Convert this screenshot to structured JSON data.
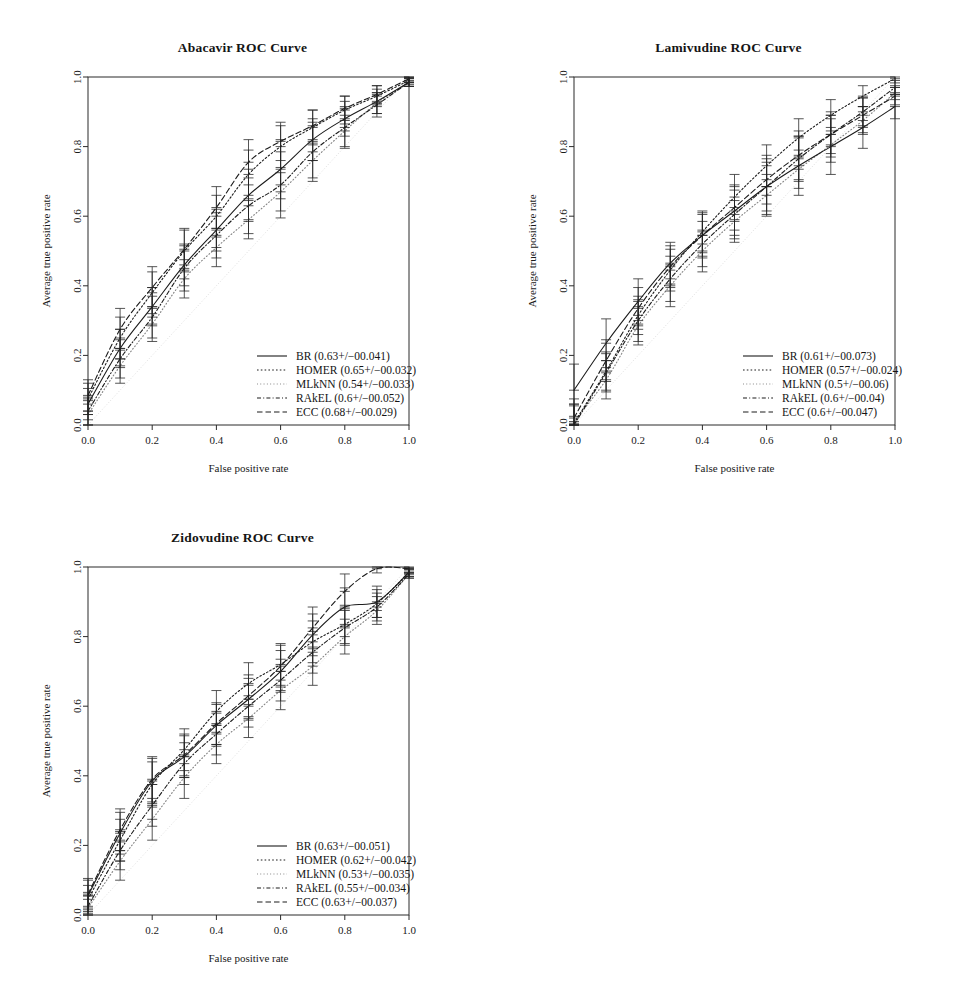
{
  "figure": {
    "background": "#ffffff",
    "line_color": "#1c1c1c",
    "panel_count": 3
  },
  "chart_data": [
    {
      "type": "line",
      "title": "Abacavir ROC Curve",
      "xlabel": "False positive rate",
      "ylabel": "Average true positive rate",
      "xlim": [
        0.0,
        1.0
      ],
      "ylim": [
        0.0,
        1.0
      ],
      "xticks": [
        "0.0",
        "0.2",
        "0.4",
        "0.6",
        "0.8",
        "1.0"
      ],
      "yticks": [
        "0.0",
        "0.2",
        "0.4",
        "0.6",
        "0.8",
        "1.0"
      ],
      "grid": false,
      "legend_position": "bottom-right",
      "x": [
        0.0,
        0.1,
        0.2,
        0.3,
        0.4,
        0.5,
        0.6,
        0.7,
        0.8,
        0.9,
        1.0
      ],
      "series": [
        {
          "name": "BR",
          "auc": "0.63",
          "auc_sd": "0.041",
          "legend": "BR (0.63+/-0.041)",
          "dash": "solid",
          "values": [
            0.06,
            0.22,
            0.34,
            0.46,
            0.56,
            0.66,
            0.735,
            0.82,
            0.88,
            0.93,
            0.985
          ],
          "err": [
            0.045,
            0.055,
            0.055,
            0.06,
            0.06,
            0.075,
            0.085,
            0.06,
            0.05,
            0.035,
            0.012
          ]
        },
        {
          "name": "HOMER",
          "auc": "0.65",
          "auc_sd": "0.032",
          "legend": "HOMER (0.65+/-0.032)",
          "dash": "dotted-fine",
          "values": [
            0.075,
            0.25,
            0.38,
            0.5,
            0.6,
            0.72,
            0.8,
            0.855,
            0.905,
            0.945,
            0.99
          ],
          "err": [
            0.045,
            0.06,
            0.06,
            0.06,
            0.06,
            0.07,
            0.06,
            0.05,
            0.04,
            0.03,
            0.012
          ]
        },
        {
          "name": "MLkNN",
          "auc": "0.54",
          "auc_sd": "0.033",
          "legend": "MLkNN (0.54+/-0.033)",
          "dash": "dotted-light",
          "values": [
            0.03,
            0.17,
            0.29,
            0.42,
            0.51,
            0.59,
            0.67,
            0.76,
            0.845,
            0.925,
            0.985
          ],
          "err": [
            0.04,
            0.05,
            0.05,
            0.055,
            0.055,
            0.055,
            0.055,
            0.05,
            0.045,
            0.03,
            0.012
          ]
        },
        {
          "name": "RAkEL",
          "auc": "0.6",
          "auc_sd": "0.052",
          "legend": "RAkEL (0.6+/-0.052)",
          "dash": "dashdot",
          "values": [
            0.04,
            0.19,
            0.31,
            0.45,
            0.545,
            0.63,
            0.69,
            0.785,
            0.855,
            0.92,
            0.985
          ],
          "err": [
            0.04,
            0.055,
            0.06,
            0.065,
            0.065,
            0.08,
            0.095,
            0.085,
            0.06,
            0.035,
            0.012
          ]
        },
        {
          "name": "ECC",
          "auc": "0.68",
          "auc_sd": "0.029",
          "legend": "ECC (0.68+/-0.029)",
          "dash": "dashed",
          "values": [
            0.085,
            0.275,
            0.395,
            0.505,
            0.625,
            0.755,
            0.815,
            0.86,
            0.91,
            0.95,
            0.995
          ],
          "err": [
            0.045,
            0.06,
            0.06,
            0.06,
            0.06,
            0.065,
            0.055,
            0.045,
            0.035,
            0.025,
            0.012
          ]
        }
      ]
    },
    {
      "type": "line",
      "title": "Lamivudine ROC Curve",
      "xlabel": "False positive rate",
      "ylabel": "Average true positive rate",
      "xlim": [
        0.0,
        1.0
      ],
      "ylim": [
        0.0,
        1.0
      ],
      "xticks": [
        "0.0",
        "0.2",
        "0.4",
        "0.6",
        "0.8",
        "1.0"
      ],
      "yticks": [
        "0.0",
        "0.2",
        "0.4",
        "0.6",
        "0.8",
        "1.0"
      ],
      "grid": false,
      "legend_position": "bottom-right",
      "x": [
        0.0,
        0.1,
        0.2,
        0.3,
        0.4,
        0.5,
        0.6,
        0.7,
        0.8,
        0.9,
        1.0
      ],
      "series": [
        {
          "name": "BR",
          "auc": "0.61",
          "auc_sd": "0.073",
          "legend": "BR (0.61+/-0.073)",
          "dash": "solid",
          "values": [
            0.1,
            0.235,
            0.355,
            0.465,
            0.545,
            0.615,
            0.685,
            0.745,
            0.8,
            0.855,
            0.915
          ],
          "err": [
            0.075,
            0.07,
            0.065,
            0.06,
            0.065,
            0.07,
            0.08,
            0.085,
            0.08,
            0.06,
            0.035
          ]
        },
        {
          "name": "HOMER",
          "auc": "0.57",
          "auc_sd": "0.024",
          "legend": "HOMER (0.57+/-0.024)",
          "dash": "dotted-fine",
          "values": [
            0.005,
            0.155,
            0.315,
            0.445,
            0.555,
            0.655,
            0.745,
            0.825,
            0.89,
            0.945,
            0.995
          ],
          "err": [
            0.055,
            0.055,
            0.055,
            0.06,
            0.06,
            0.065,
            0.06,
            0.055,
            0.045,
            0.03,
            0.012
          ]
        },
        {
          "name": "MLkNN",
          "auc": "0.5",
          "auc_sd": "0.06",
          "legend": "MLkNN (0.5+/-0.06)",
          "dash": "dotted-light",
          "values": [
            0.01,
            0.13,
            0.285,
            0.4,
            0.5,
            0.585,
            0.66,
            0.735,
            0.805,
            0.875,
            0.955
          ],
          "err": [
            0.05,
            0.055,
            0.055,
            0.06,
            0.06,
            0.06,
            0.06,
            0.055,
            0.05,
            0.04,
            0.02
          ]
        },
        {
          "name": "RAkEL",
          "auc": "0.6",
          "auc_sd": "0.04",
          "legend": "RAkEL (0.6+/-0.04)",
          "dash": "dashdot",
          "values": [
            0.0,
            0.15,
            0.3,
            0.42,
            0.52,
            0.605,
            0.685,
            0.765,
            0.835,
            0.9,
            0.97
          ],
          "err": [
            0.055,
            0.055,
            0.06,
            0.065,
            0.065,
            0.07,
            0.07,
            0.065,
            0.055,
            0.04,
            0.02
          ]
        },
        {
          "name": "ECC",
          "auc": "0.6",
          "auc_sd": "0.047",
          "legend": "ECC (0.6+/-0.047)",
          "dash": "dashed",
          "values": [
            0.02,
            0.185,
            0.335,
            0.455,
            0.545,
            0.625,
            0.705,
            0.775,
            0.835,
            0.89,
            0.945
          ],
          "err": [
            0.055,
            0.06,
            0.06,
            0.06,
            0.06,
            0.065,
            0.07,
            0.07,
            0.065,
            0.05,
            0.025
          ]
        }
      ]
    },
    {
      "type": "line",
      "title": "Zidovudine ROC Curve",
      "xlabel": "False positive rate",
      "ylabel": "Average true positive rate",
      "xlim": [
        0.0,
        1.0
      ],
      "ylim": [
        0.0,
        1.0
      ],
      "xticks": [
        "0.0",
        "0.2",
        "0.4",
        "0.6",
        "0.8",
        "1.0"
      ],
      "yticks": [
        "0.0",
        "0.2",
        "0.4",
        "0.6",
        "0.8",
        "1.0"
      ],
      "grid": false,
      "legend_position": "bottom-right",
      "x": [
        0.0,
        0.1,
        0.2,
        0.3,
        0.4,
        0.5,
        0.6,
        0.7,
        0.8,
        0.9,
        1.0
      ],
      "series": [
        {
          "name": "BR",
          "auc": "0.63",
          "auc_sd": "0.051",
          "legend": "BR (0.63+/-0.051)",
          "dash": "solid",
          "values": [
            0.055,
            0.235,
            0.385,
            0.455,
            0.545,
            0.62,
            0.7,
            0.805,
            0.885,
            0.9,
            0.985
          ],
          "err": [
            0.045,
            0.06,
            0.065,
            0.06,
            0.06,
            0.06,
            0.06,
            0.06,
            0.055,
            0.045,
            0.012
          ]
        },
        {
          "name": "HOMER",
          "auc": "0.62",
          "auc_sd": "0.042",
          "legend": "HOMER (0.62+/-0.042)",
          "dash": "dotted-fine",
          "values": [
            0.045,
            0.215,
            0.375,
            0.475,
            0.585,
            0.665,
            0.72,
            0.785,
            0.835,
            0.895,
            0.985
          ],
          "err": [
            0.04,
            0.06,
            0.065,
            0.06,
            0.06,
            0.06,
            0.06,
            0.06,
            0.055,
            0.04,
            0.012
          ]
        },
        {
          "name": "MLkNN",
          "auc": "0.53",
          "auc_sd": "0.035",
          "legend": "MLkNN (0.53+/-0.035)",
          "dash": "dotted-light",
          "values": [
            0.02,
            0.155,
            0.275,
            0.395,
            0.49,
            0.565,
            0.645,
            0.715,
            0.8,
            0.875,
            0.98
          ],
          "err": [
            0.035,
            0.055,
            0.06,
            0.06,
            0.055,
            0.055,
            0.055,
            0.055,
            0.05,
            0.04,
            0.012
          ]
        },
        {
          "name": "RAkEL",
          "auc": "0.55",
          "auc_sd": "0.034",
          "legend": "RAkEL (0.55+/-0.034)",
          "dash": "dashdot",
          "values": [
            0.025,
            0.185,
            0.315,
            0.435,
            0.52,
            0.6,
            0.675,
            0.755,
            0.825,
            0.885,
            0.98
          ],
          "err": [
            0.04,
            0.055,
            0.06,
            0.06,
            0.06,
            0.06,
            0.06,
            0.06,
            0.05,
            0.04,
            0.012
          ]
        },
        {
          "name": "ECC",
          "auc": "0.63",
          "auc_sd": "0.037",
          "legend": "ECC (0.63+/-0.037)",
          "dash": "dashed",
          "values": [
            0.06,
            0.245,
            0.39,
            0.46,
            0.55,
            0.63,
            0.715,
            0.825,
            0.93,
            0.995,
            0.995
          ],
          "err": [
            0.045,
            0.06,
            0.065,
            0.06,
            0.06,
            0.06,
            0.06,
            0.06,
            0.05,
            0.012,
            0.012
          ]
        }
      ]
    }
  ]
}
